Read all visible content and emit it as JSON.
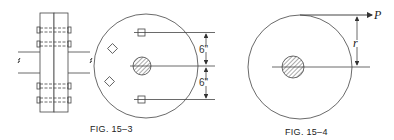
{
  "figures": [
    {
      "id": "fig-15-3",
      "caption": "FIG. 15–3",
      "dimensions": {
        "upper": "6\"",
        "lower": "6\""
      }
    },
    {
      "id": "fig-15-4",
      "caption": "FIG. 15–4",
      "labels": {
        "force": "P",
        "radius": "r"
      }
    }
  ],
  "colors": {
    "line": "#333333",
    "background": "#ffffff"
  }
}
